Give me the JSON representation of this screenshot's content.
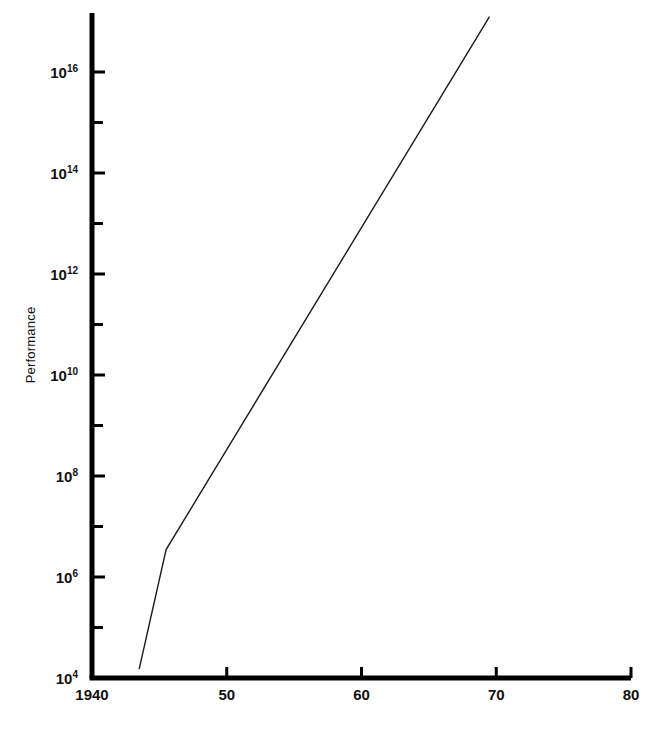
{
  "chart_data": {
    "type": "line",
    "title": "",
    "subtitle": "",
    "xlabel": "",
    "ylabel": "Performance",
    "yscale": "log",
    "xscale": "linear",
    "grid": false,
    "legend": null,
    "xlim": [
      1940,
      1980
    ],
    "ylim": [
      10000,
      1.25e+17
    ],
    "x_tick_labels": [
      "1940",
      "50",
      "60",
      "70",
      "80"
    ],
    "x_tick_values": [
      1940,
      1950,
      1960,
      1970,
      1980
    ],
    "y_major_tick_labels": [
      "10",
      "10",
      "10",
      "10",
      "10",
      "10",
      "10"
    ],
    "y_major_tick_exponents": [
      "16",
      "14",
      "12",
      "10",
      "8",
      "6",
      "4"
    ],
    "y_major_tick_values": [
      1e+16,
      100000000000000.0,
      1000000000000.0,
      10000000000.0,
      100000000.0,
      1000000.0,
      10000.0
    ],
    "y_minor_tick_values": [
      1000000000000000.0,
      10000000000000.0,
      100000000000.0,
      1000000000.0,
      10000000.0,
      100000.0
    ],
    "series": [
      {
        "name": "Performance",
        "x": [
          1943.5,
          1945.5,
          1969.5
        ],
        "y": [
          15000,
          3500000,
          1.25e+17
        ],
        "color": "#1a1a1a",
        "linewidth": 1.4
      }
    ],
    "annotations": [],
    "axis_color": "#000000",
    "background_color": "#ffffff"
  },
  "geometry": {
    "plot_left_px": 92,
    "plot_right_px": 631,
    "plot_top_px": 13,
    "plot_bottom_px": 678,
    "y_decade_px": 50.5,
    "x_year_px": 13.3
  },
  "axis": {
    "y_label_text": "Performance"
  }
}
